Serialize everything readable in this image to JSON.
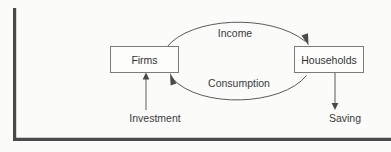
{
  "diagram": {
    "nodes": [
      {
        "id": "firms",
        "label": "Firms"
      },
      {
        "id": "households",
        "label": "Households"
      }
    ],
    "flows": [
      {
        "id": "income",
        "label": "Income",
        "from": "firms",
        "to": "households",
        "shape": "arc-top"
      },
      {
        "id": "consumption",
        "label": "Consumption",
        "from": "households",
        "to": "firms",
        "shape": "arc-bottom"
      }
    ],
    "externals": [
      {
        "id": "investment",
        "label": "Investment",
        "direction": "up",
        "target": "firms"
      },
      {
        "id": "saving",
        "label": "Saving",
        "direction": "down",
        "source": "households"
      }
    ],
    "colors": {
      "background": "#fbfbfa",
      "box_fill": "#fdfdfc",
      "box_stroke": "#7b7b7b",
      "arrow": "#5a5a5a",
      "frame": "#4a4a4a",
      "text": "#333333"
    }
  }
}
